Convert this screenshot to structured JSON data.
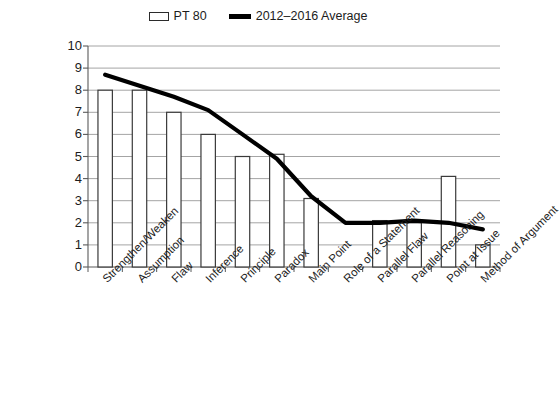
{
  "legend": {
    "position": "top-center",
    "entries": [
      {
        "label": "PT 80",
        "marker": "open-rectangle-swatch"
      },
      {
        "label": "2012–2016 Average",
        "marker": "thick-line-swatch"
      }
    ]
  },
  "colors": {
    "bar_fill": "#ffffff",
    "bar_stroke": "#3a3a3a",
    "line": "#000000",
    "gridline": "#9a9a9a",
    "axis": "#5a5a5a",
    "text": "#1c1c1c",
    "background": "#ffffff"
  },
  "chart_data": {
    "type": "bar",
    "title": "",
    "subtitle": "",
    "xlabel": "",
    "ylabel": "",
    "ylim": [
      0,
      10
    ],
    "ytick_step": 1,
    "yticks": [
      "10",
      "9",
      "8",
      "7",
      "6",
      "5",
      "4",
      "3",
      "2",
      "1",
      "0"
    ],
    "grid": true,
    "legend_position": "top-center",
    "categories": [
      "Strengthen/Weaken",
      "Assumption",
      "Flaw",
      "Inference",
      "Principle",
      "Paradox",
      "Main Point",
      "Role of a Statement",
      "Parallel Flaw",
      "Parallel Reasoning",
      "Point at Issue",
      "Method of Argument"
    ],
    "series": [
      {
        "name": "PT 80",
        "type": "bar",
        "values": [
          8,
          8,
          7,
          6,
          5,
          5.1,
          3.1,
          0,
          2.1,
          2,
          4.1,
          1
        ]
      },
      {
        "name": "2012–2016 Average",
        "type": "line",
        "values": [
          8.7,
          8.2,
          7.7,
          7.1,
          6.0,
          4.9,
          3.2,
          2.0,
          2.0,
          2.1,
          2.0,
          1.7
        ]
      }
    ]
  }
}
